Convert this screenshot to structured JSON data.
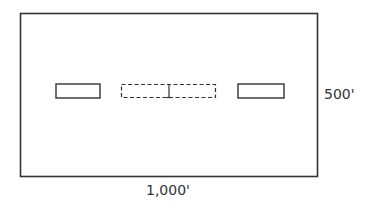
{
  "diagram": {
    "type": "site-plan",
    "stroke_color": "#333333",
    "lot": {
      "width_label": "1,000'",
      "height_label": "500'"
    },
    "elements": [
      {
        "id": "left-building",
        "style": "solid"
      },
      {
        "id": "center-building",
        "style": "dashed",
        "note": "divided into two halves"
      },
      {
        "id": "right-building",
        "style": "solid"
      }
    ]
  }
}
